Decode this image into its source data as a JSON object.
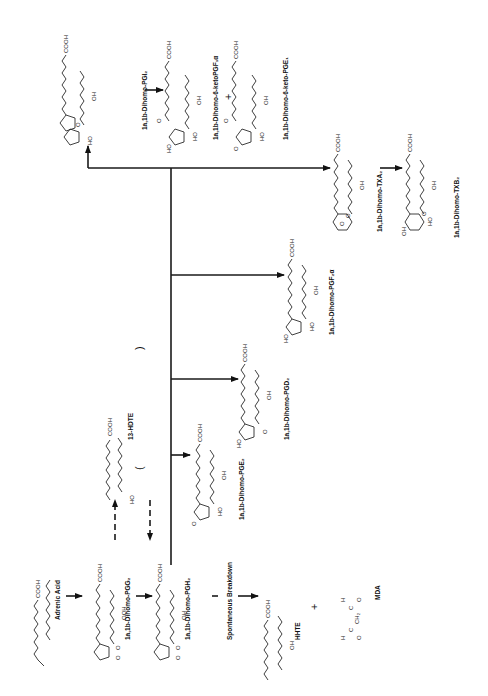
{
  "figure": {
    "orientation": "rotated-90-ccw"
  },
  "compounds": {
    "adrenic_acid": {
      "label": "Adrenic Acid",
      "group": "COOH"
    },
    "pgg2": {
      "label": "1a,1b-Dihomo-PGG₂",
      "groups": [
        "COOH",
        "OOH",
        "O",
        "O"
      ]
    },
    "pgh2": {
      "label": "1a,1b-Dihomo-PGH₂",
      "groups": [
        "COOH",
        "OH",
        "O",
        "O"
      ]
    },
    "hdte": {
      "label": "13-HDTE",
      "groups": [
        "COOH",
        "HO"
      ]
    },
    "hhte": {
      "label": "HHTE",
      "groups": [
        "COOH",
        "OH"
      ]
    },
    "mda": {
      "label": "MDA",
      "groups": [
        "H",
        "C",
        "O",
        "CH₂",
        "C",
        "O",
        "H"
      ]
    },
    "pge2": {
      "label": "1a,1b-Dihomo-PGE₂",
      "groups": [
        "COOH",
        "OH",
        "O",
        "HO"
      ]
    },
    "pgd2": {
      "label": "1a,1b-Dihomo-PGD₂",
      "groups": [
        "COOH",
        "OH",
        "HO",
        "O"
      ]
    },
    "pgf2a": {
      "label": "1a,1b-Dihomo-PGF₂α",
      "groups": [
        "COOH",
        "OH",
        "HO",
        "HO"
      ]
    },
    "txa2": {
      "label": "1a,1b-Dihomo-TXA₂",
      "groups": [
        "COOH",
        "OH",
        "O",
        "O"
      ]
    },
    "txb2": {
      "label": "1a,1b-Dihomo-TXB₂",
      "groups": [
        "COOH",
        "OH",
        "OH",
        "HO",
        "O"
      ]
    },
    "pgi2": {
      "label": "1a,1b-Dihomo-PGI₂",
      "groups": [
        "COOH",
        "OH",
        "O",
        "HO"
      ]
    },
    "keto_pgf1a": {
      "label": "1a,1b-Dihomo-6-ketoPGF₁α",
      "groups": [
        "COOH",
        "OH",
        "O",
        "HO",
        "HO"
      ]
    },
    "keto_pge1": {
      "label": "1a,1b-Dihomo-6-keto-PGE₁",
      "groups": [
        "COOH",
        "OH",
        "O",
        "O",
        "HO"
      ]
    }
  },
  "annotations": {
    "spontaneous": "Spontaneous Breakdown",
    "plus": "+",
    "paren_open": "(",
    "paren_close": ")"
  },
  "edges": [
    {
      "from": "adrenic_acid",
      "to": "pgg2",
      "style": "solid"
    },
    {
      "from": "pgg2",
      "to": "pgh2",
      "style": "solid"
    },
    {
      "from": "pgg2",
      "to": "hdte",
      "style": "dashed"
    },
    {
      "from": "hdte",
      "to": "pgh2",
      "style": "dashed"
    },
    {
      "from": "pgh2",
      "to": "hhte",
      "style": "solid",
      "via": "Spontaneous Breakdown"
    },
    {
      "from": "pgh2",
      "to": "pge2",
      "style": "solid"
    },
    {
      "from": "pgh2",
      "to": "pgd2",
      "style": "solid"
    },
    {
      "from": "pgh2",
      "to": "pgf2a",
      "style": "solid"
    },
    {
      "from": "pgh2",
      "to": "txa2",
      "style": "solid"
    },
    {
      "from": "pgh2",
      "to": "pgi2",
      "style": "solid"
    },
    {
      "from": "txa2",
      "to": "txb2",
      "style": "solid"
    },
    {
      "from": "pgi2",
      "to": "keto_pgf1a",
      "style": "solid"
    }
  ]
}
